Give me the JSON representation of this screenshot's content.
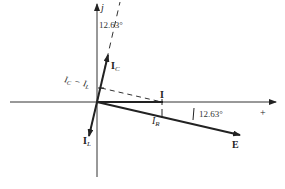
{
  "diagram": {
    "type": "phasor-diagram",
    "axes": {
      "imaginary_label": "j",
      "real_positive_label": "+"
    },
    "phasors": [
      {
        "id": "IC",
        "label_main": "I",
        "label_sub": "C",
        "bold": true
      },
      {
        "id": "IL",
        "label_main": "I",
        "label_sub": "L",
        "bold": true
      },
      {
        "id": "I",
        "label_main": "I",
        "label_sub": "",
        "bold": true
      },
      {
        "id": "IR",
        "label_main": "I",
        "label_sub": "R",
        "bold": false
      },
      {
        "id": "E",
        "label_main": "E",
        "label_sub": "",
        "bold": true
      }
    ],
    "difference_label": {
      "a_main": "I",
      "a_sub": "C",
      "op": "−",
      "b_main": "I",
      "b_sub": "L"
    },
    "angles": {
      "upper": "12.63°",
      "lower": "12.63°"
    },
    "colors": {
      "ink": "#222222",
      "background": "#ffffff"
    }
  }
}
